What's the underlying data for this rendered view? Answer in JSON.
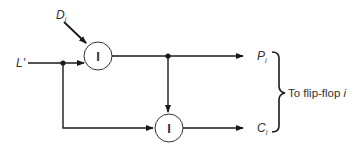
{
  "diagram": {
    "inputs": {
      "d_label": "D",
      "d_sub": "i",
      "l_label": "L'"
    },
    "gates": [
      {
        "id": "gate-top",
        "symbol": "I"
      },
      {
        "id": "gate-bottom",
        "symbol": "I"
      }
    ],
    "outputs": {
      "p_label": "P",
      "p_sub": "i",
      "c_label": "C",
      "c_sub": "i"
    },
    "brace_text": "To flip-flop ",
    "brace_text_var": "i",
    "colors": {
      "line": "#1a1a1a",
      "text": "#333333",
      "background": "#ffffff"
    }
  }
}
